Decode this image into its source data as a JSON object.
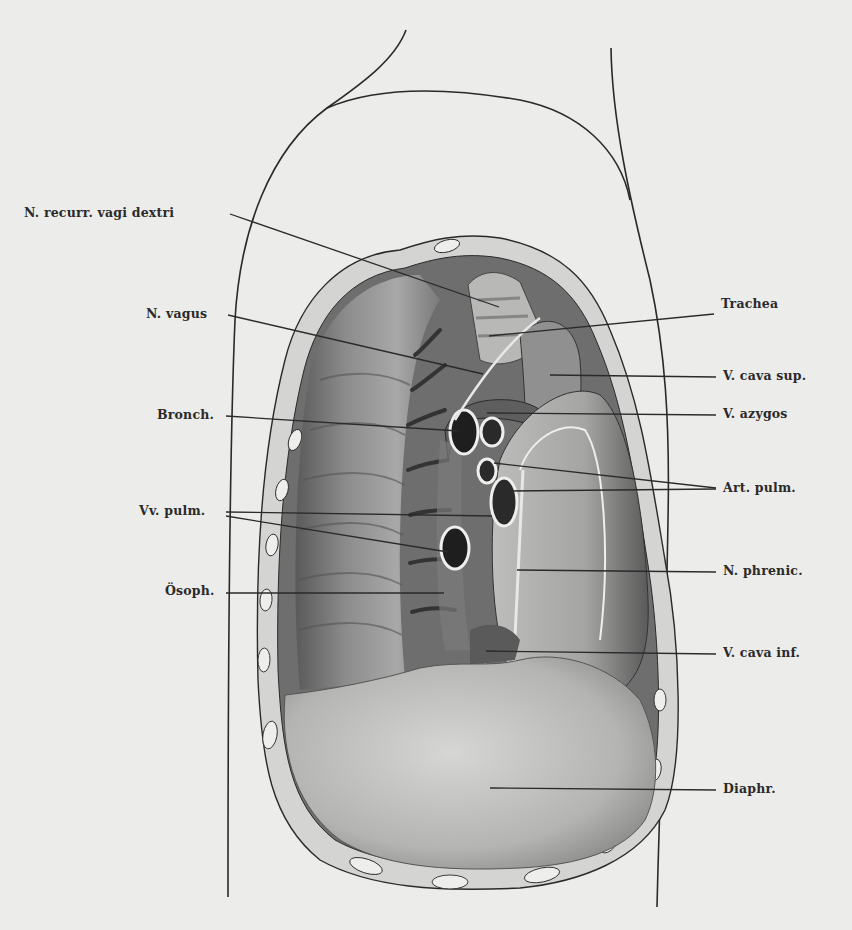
{
  "figure": {
    "type": "anatomical illustration",
    "colors": {
      "paper": "#ececea",
      "ink": "#2a2a2a",
      "shade_dark": "#4a4a4a",
      "shade_mid": "#8a8a8a",
      "shade_light": "#c8c8c6"
    }
  },
  "labels_left": [
    {
      "id": "n-recurr",
      "text": "N. recurr. vagi dextri"
    },
    {
      "id": "n-vagus",
      "text": "N. vagus"
    },
    {
      "id": "bronch",
      "text": "Bronch."
    },
    {
      "id": "vv-pulm",
      "text": "Vv. pulm."
    },
    {
      "id": "osoph",
      "text": "Ösoph."
    }
  ],
  "labels_right": [
    {
      "id": "trachea",
      "text": "Trachea"
    },
    {
      "id": "v-cava-sup",
      "text": "V. cava sup."
    },
    {
      "id": "v-azygos",
      "text": "V. azygos"
    },
    {
      "id": "art-pulm",
      "text": "Art. pulm."
    },
    {
      "id": "n-phrenic",
      "text": "N. phrenic."
    },
    {
      "id": "v-cava-inf",
      "text": "V. cava inf."
    },
    {
      "id": "diaphr",
      "text": "Diaphr."
    }
  ]
}
